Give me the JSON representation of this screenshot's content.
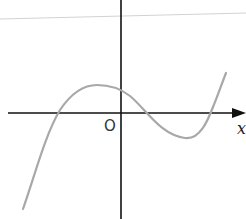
{
  "diagram": {
    "type": "function-graph",
    "labels": {
      "origin": "O",
      "x_axis": "x"
    },
    "colors": {
      "axis": "#111111",
      "curve": "#a8a8a8",
      "guide_line": "#cfcfcf"
    },
    "features": {
      "x_intercepts": 3,
      "local_max_left_of_origin": true,
      "y_intercept_positive": true,
      "local_min_right_of_origin": true
    }
  }
}
